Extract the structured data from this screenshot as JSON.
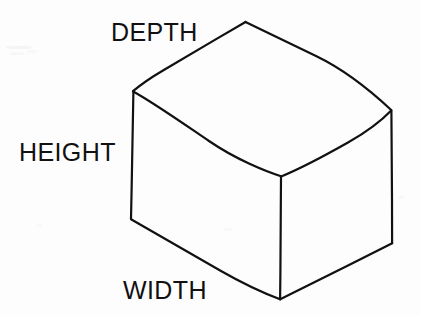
{
  "diagram": {
    "type": "line-drawing",
    "background_color": "#fdfdfd",
    "stroke_color": "#111111",
    "stroke_width": 2.2,
    "labels": [
      {
        "id": "depth",
        "text": "DEPTH",
        "x": 111,
        "y": 20,
        "font_size": 25
      },
      {
        "id": "height",
        "text": "HEIGHT",
        "x": 19,
        "y": 140,
        "font_size": 25
      },
      {
        "id": "width",
        "text": "WIDTH",
        "x": 123,
        "y": 278,
        "font_size": 25
      }
    ],
    "vertices": {
      "top_back": {
        "x": 245,
        "y": 22
      },
      "top_left": {
        "x": 133,
        "y": 91
      },
      "top_right": {
        "x": 391,
        "y": 110
      },
      "front_top": {
        "x": 281,
        "y": 176
      },
      "bottom_left": {
        "x": 131,
        "y": 219
      },
      "bottom_front": {
        "x": 280,
        "y": 299
      },
      "bottom_right": {
        "x": 392,
        "y": 243
      }
    },
    "edges": [
      {
        "id": "top-back-left",
        "from": "top_back",
        "to": "top_left"
      },
      {
        "id": "top-back-right",
        "from": "top_back",
        "to": "top_right"
      },
      {
        "id": "top-front-left",
        "from": "top_left",
        "to": "front_top"
      },
      {
        "id": "top-front-right",
        "from": "front_top",
        "to": "top_right"
      },
      {
        "id": "left-vertical",
        "from": "top_left",
        "to": "bottom_left"
      },
      {
        "id": "center-vertical",
        "from": "front_top",
        "to": "bottom_front"
      },
      {
        "id": "right-vertical",
        "from": "top_right",
        "to": "bottom_right"
      },
      {
        "id": "bottom-left-edge",
        "from": "bottom_left",
        "to": "bottom_front"
      },
      {
        "id": "bottom-right-edge",
        "from": "bottom_front",
        "to": "bottom_right"
      }
    ],
    "path_data": {
      "top_face": "M 245,22 L 133,91 L 281,176 L 391,110 Z",
      "left_face": "M 133,91 L 131,219 L 280,299 L 281,176 Z",
      "right_face": "M 281,176 L 280,299 L 392,243 L 391,110 Z"
    },
    "hand_drawn_strokes": {
      "top_back_left": "M 245.5,22 C 218,38 190,54.5 163,70.5 C 151,77.5 141,84.5 133,91.2",
      "top_back_right": "M 245.5,22 C 268,33 292,44.5 316,56 C 345,70 372,92 391.2,110",
      "top_front_left": "M 133.2,91.5 C 154,103 181,122 209,141 C 236,159.5 266,171.5 281,176.2",
      "top_front_right": "M 281.2,176.4 C 302,168 325,155.5 348,142.5 C 368,131 383,119 391.2,110.4",
      "left_vertical": "M 133.4,91.6 C 132.8,122 132.2,160 131.6,190 C 131.3,205 131.1,213 131.0,219.0",
      "center_vertical": "M 281.0,176.6 C 280.8,206 280.6,243 280.4,272 C 280.3,286 280.2,294 280.1,299.2",
      "right_vertical": "M 391.4,110.6 C 391.6,138 391.8,172 392.0,200 C 392.1,222 392.1,235 392.1,243.2",
      "bottom_left": "M 131.0,219.2 C 157,234 189,252.5 221,271 C 249,287 270,295.5 280.1,299.3",
      "bottom_right": "M 280.2,299.3 C 301,289 325,277 349,265 C 371,254 385,247 392.2,243.3"
    }
  }
}
